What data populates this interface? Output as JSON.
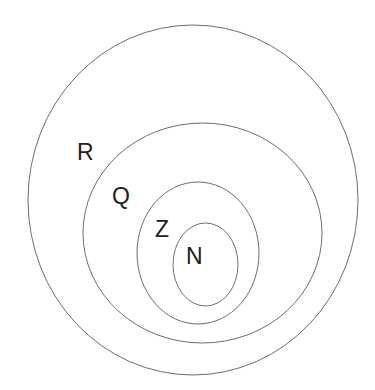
{
  "diagram": {
    "type": "nested-sets",
    "background": "#ffffff",
    "stroke_color": "#6e6e6e",
    "label_color": "#222222",
    "sets": [
      {
        "id": "R",
        "label": "R",
        "ellipse": {
          "cx": 193,
          "cy": 200,
          "rx": 165,
          "ry": 175
        },
        "label_pos": {
          "x": 77,
          "y": 141
        }
      },
      {
        "id": "Q",
        "label": "Q",
        "ellipse": {
          "cx": 202.5,
          "cy": 233,
          "rx": 119.5,
          "ry": 110
        },
        "label_pos": {
          "x": 112,
          "y": 185
        }
      },
      {
        "id": "Z",
        "label": "Z",
        "ellipse": {
          "cx": 198,
          "cy": 253,
          "rx": 61,
          "ry": 71
        },
        "label_pos": {
          "x": 155,
          "y": 218
        }
      },
      {
        "id": "N",
        "label": "N",
        "ellipse": {
          "cx": 205.5,
          "cy": 264.5,
          "rx": 32.5,
          "ry": 41.5
        },
        "label_pos": {
          "x": 186,
          "y": 245
        }
      }
    ],
    "relationships": "N ⊂ Z ⊂ Q ⊂ R"
  }
}
